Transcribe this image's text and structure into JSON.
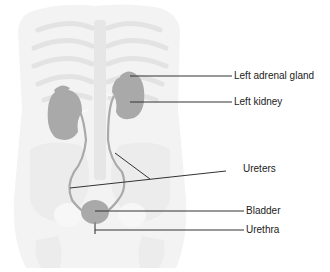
{
  "diagram": {
    "labels": [
      {
        "id": "left-adrenal-gland",
        "text": "Left adrenal gland"
      },
      {
        "id": "left-kidney",
        "text": "Left kidney"
      },
      {
        "id": "ureters",
        "text": "Ureters"
      },
      {
        "id": "bladder",
        "text": "Bladder"
      },
      {
        "id": "urethra",
        "text": "Urethra"
      }
    ],
    "colors": {
      "organ_fill": "#a9a9a9",
      "body_silhouette": "#f1f1f1",
      "skeleton": "#e4e4e4",
      "leader_line": "#333333",
      "label_text": "#222222"
    }
  }
}
